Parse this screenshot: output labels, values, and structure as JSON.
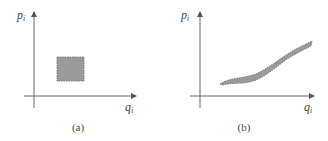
{
  "panels": [
    {
      "id": "a",
      "caption": "(a)",
      "y_axis_label": "p",
      "y_axis_subscript": "i",
      "x_axis_label": "q",
      "x_axis_subscript": "i",
      "region_shape": "rectangle"
    },
    {
      "id": "b",
      "caption": "(b)",
      "y_axis_label": "p",
      "y_axis_subscript": "i",
      "x_axis_label": "q",
      "x_axis_subscript": "i",
      "region_shape": "curved band"
    }
  ],
  "colors": {
    "axis": "#555555",
    "region_fill": "#9a9a9a",
    "region_edge": "#7a7a7a",
    "text": "#444444"
  }
}
